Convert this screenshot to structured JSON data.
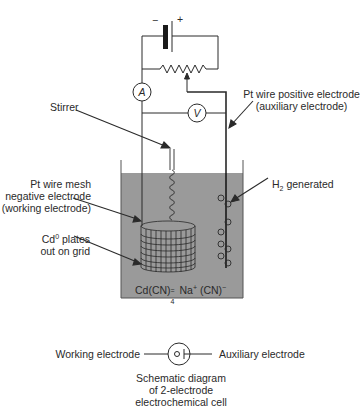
{
  "diagram": {
    "battery": {
      "minus_label": "−",
      "plus_label": "+"
    },
    "meters": {
      "ammeter": "A",
      "voltmeter": "V"
    },
    "labels": {
      "stirrer": "Stirrer",
      "positive_electrode_line1": "Pt wire positive electrode",
      "positive_electrode_line2": "(auxiliary electrode)",
      "negative_electrode_line1": "Pt wire mesh",
      "negative_electrode_line2": "negative electrode",
      "negative_electrode_line3": "(working electrode)",
      "cd_plates_line1_prefix": "Cd",
      "cd_plates_line1_sup": "0",
      "cd_plates_line1_suffix": " plates",
      "cd_plates_line2": "out on grid",
      "h2_prefix": "H",
      "h2_sub": "2",
      "h2_suffix": " generated",
      "solution_prefix": "Cd(CN)",
      "solution_sup": "=",
      "solution_sub": "4",
      "solution_na": " Na",
      "solution_na_sup": "+",
      "solution_cn": " (CN)",
      "solution_cn_sup": "−"
    },
    "schematic": {
      "left_label": "Working electrode",
      "right_label": "Auxiliary electrode",
      "caption_line1": "Schematic diagram",
      "caption_line2": "of 2-electrode",
      "caption_line3": "electrochemical cell"
    },
    "colors": {
      "line": "#2a2a2a",
      "solution_fill": "#9a9a9a",
      "background": "#ffffff"
    }
  }
}
